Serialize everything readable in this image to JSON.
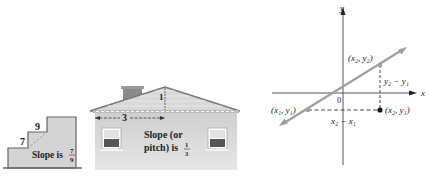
{
  "stairs": {
    "rise_label": "7",
    "run_label": "9",
    "slope_text": "Slope is",
    "slope_num": "7",
    "slope_den": "9"
  },
  "house": {
    "rise_label": "1",
    "run_label": "3",
    "slope_line1": "Slope (or",
    "slope_line2": "pitch) is",
    "slope_num": "1",
    "slope_den": "3"
  },
  "graph": {
    "x_axis_label": "x",
    "y_axis_label": "y",
    "origin_label": "0",
    "point1_label": "(x₁, y₁)",
    "point2_label": "(x₂, y₂)",
    "point3_label": "(x₂, y₁)",
    "rise_label": "y₂ − y₁",
    "run_label": "x₂ − x₁"
  },
  "colors": {
    "fill_gray": "#d2d2d2",
    "line_gray": "#9a9a9a",
    "stroke_dark": "#555555",
    "text": "#222222"
  }
}
